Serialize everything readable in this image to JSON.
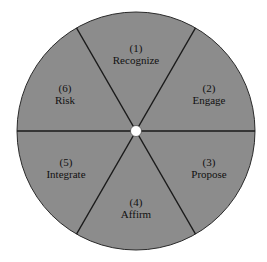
{
  "diagram": {
    "type": "segmented-wheel",
    "colors": {
      "background": "#ffffff",
      "fill": "#8c8c8c",
      "lines": "#1a1a1a",
      "center_hole": "#ffffff",
      "text": "#111111"
    },
    "segments": [
      {
        "number": "(1)",
        "label": "Recognize"
      },
      {
        "number": "(2)",
        "label": "Engage"
      },
      {
        "number": "(3)",
        "label": "Propose"
      },
      {
        "number": "(4)",
        "label": "Affirm"
      },
      {
        "number": "(5)",
        "label": "Integrate"
      },
      {
        "number": "(6)",
        "label": "Risk"
      }
    ]
  }
}
